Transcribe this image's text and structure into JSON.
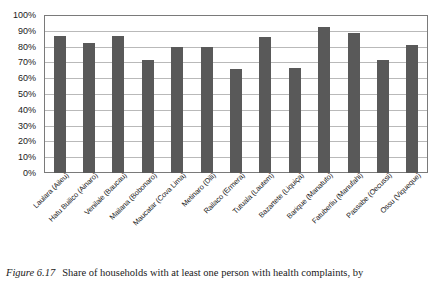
{
  "caption": {
    "figure_number": "Figure 6.17",
    "text": "Share of households with at least one person with health complaints, by"
  },
  "chart_data": {
    "type": "bar",
    "title": "",
    "xlabel": "",
    "ylabel": "",
    "ylim": [
      0,
      100
    ],
    "y_unit": "%",
    "grid": true,
    "legend": "none",
    "bar_color": "#595959",
    "axis_color": "#7a7a7a",
    "gridline_color": "#b9b9b9",
    "yticks": [
      "0%",
      "10%",
      "20%",
      "30%",
      "40%",
      "50%",
      "60%",
      "70%",
      "80%",
      "90%",
      "100%"
    ],
    "ytick_values": [
      0,
      10,
      20,
      30,
      40,
      50,
      60,
      70,
      80,
      90,
      100
    ],
    "categories": [
      "Laulara (Aileu)",
      "Hatu Builico (Ainaro)",
      "Venilale (Baucau)",
      "Mailana (Bobonaro)",
      "Maucatar (Cova Lima)",
      "Metinaro (Dili)",
      "Railaco (Ermera)",
      "Tutuala (Lautem)",
      "Bazartete (Liquiça)",
      "Barique (Manatuto)",
      "Fatuberliu (Manufahi)",
      "Passabe (Oecussi)",
      "Ossu (Viqueque)"
    ],
    "values": [
      87,
      83,
      87,
      72,
      80,
      80,
      66,
      86.5,
      67,
      93,
      89.5,
      72,
      81.5
    ]
  }
}
